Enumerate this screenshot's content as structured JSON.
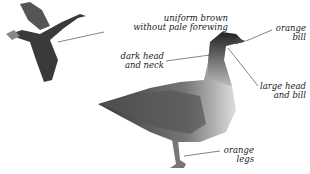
{
  "diagram": {
    "labels": {
      "forewing": [
        "uniform brown",
        "without pale forewing"
      ],
      "head_neck": [
        "dark head",
        "and neck"
      ],
      "bill": [
        "orange",
        "bill"
      ],
      "head_bill": [
        "large head",
        "and bill"
      ],
      "legs": [
        "orange",
        "legs"
      ]
    },
    "colors": {
      "ink": "#222222",
      "dark_plumage": "#2a2a2a",
      "mid_plumage": "#777777",
      "light_plumage": "#d8d8d8"
    }
  }
}
